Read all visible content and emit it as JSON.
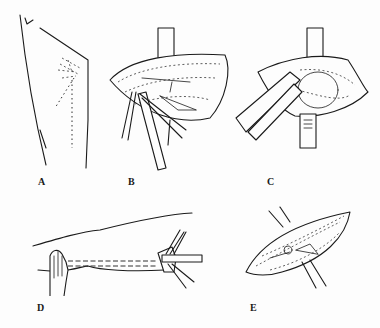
{
  "figure": {
    "panels": [
      {
        "id": "A",
        "label": "A",
        "description": "Thigh with dotted incision outline"
      },
      {
        "id": "B",
        "label": "B",
        "description": "Opened wound with retractors and forceps"
      },
      {
        "id": "C",
        "label": "C",
        "description": "Wound with retractors and instrument inserted"
      },
      {
        "id": "D",
        "label": "D",
        "description": "Arm with hand and tube/instrument inserted"
      },
      {
        "id": "E",
        "label": "E",
        "description": "Closed wound with retractors"
      }
    ],
    "colors": {
      "line": "#1a1a1a",
      "background": "#fdfdfd"
    }
  }
}
